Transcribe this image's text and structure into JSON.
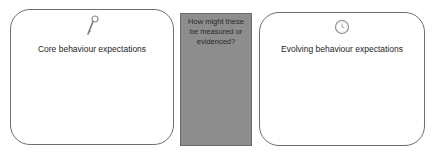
{
  "diagram": {
    "left_card": {
      "label": "Core behaviour expectations",
      "icon": "key-icon"
    },
    "center_panel": {
      "lines": [
        "How might these",
        "be measured or",
        "evidenced?"
      ],
      "background_color": "#8d8d8d"
    },
    "right_card": {
      "label": "Evolving behaviour expectations",
      "icon": "clock-icon"
    }
  }
}
